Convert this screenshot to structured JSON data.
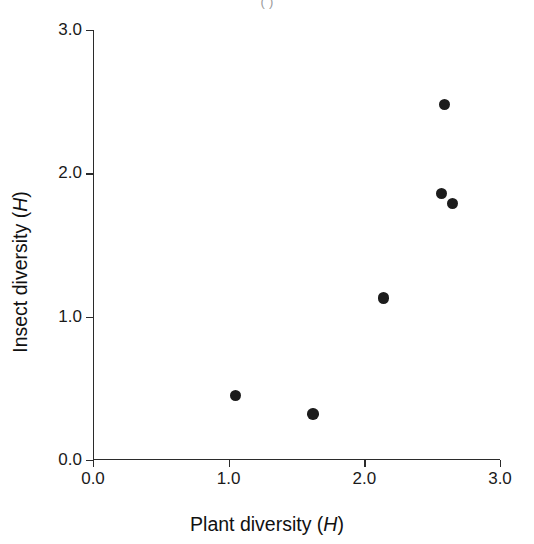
{
  "figure": {
    "background_color": "#ffffff",
    "ink_color": "#1c1c1c",
    "top_clipped_caption": "(    )"
  },
  "chart_data": {
    "type": "scatter",
    "title": "",
    "xlabel_text": "Plant diversity (",
    "xlabel_italic": "H",
    "xlabel_close": ")",
    "ylabel_text": "Insect diversity (",
    "ylabel_italic": "H",
    "ylabel_close": ")",
    "xlabel": "Plant diversity (H)",
    "ylabel": "Insect diversity (H)",
    "xlim": [
      0.0,
      3.0
    ],
    "ylim": [
      0.0,
      3.0
    ],
    "xticks": [
      0.0,
      1.0,
      2.0,
      3.0
    ],
    "yticks": [
      0.0,
      1.0,
      2.0,
      3.0
    ],
    "xtick_labels": [
      "0.0",
      "1.0",
      "2.0",
      "3.0"
    ],
    "ytick_labels": [
      "0.0",
      "1.0",
      "2.0",
      "3.0"
    ],
    "grid": false,
    "legend": null,
    "marker": "filled-circle",
    "marker_color": "#1c1c1c",
    "marker_size_px": 11.5,
    "x": [
      1.05,
      1.62,
      2.14,
      2.57,
      2.65,
      2.59
    ],
    "y": [
      0.45,
      0.32,
      1.13,
      1.86,
      1.79,
      2.48
    ],
    "points": [
      {
        "x": 1.05,
        "y": 0.45
      },
      {
        "x": 1.62,
        "y": 0.32
      },
      {
        "x": 2.14,
        "y": 1.13
      },
      {
        "x": 2.57,
        "y": 1.86
      },
      {
        "x": 2.65,
        "y": 1.79
      },
      {
        "x": 2.59,
        "y": 2.48
      }
    ]
  }
}
